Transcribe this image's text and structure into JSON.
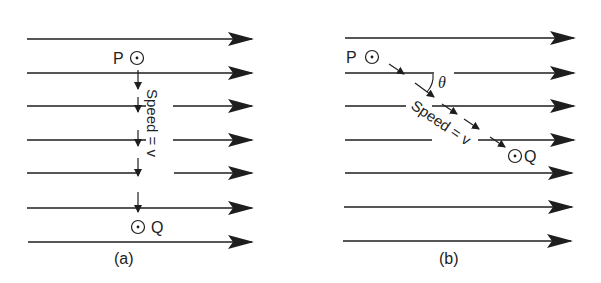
{
  "colors": {
    "ink": "#1e1e1e",
    "background": "#ffffff"
  },
  "panel_a": {
    "caption": "(a)",
    "point_p": "P",
    "point_q": "Q",
    "speed_label": "Speed = v",
    "field_lines": 7,
    "path": "vertical, perpendicular to field lines"
  },
  "panel_b": {
    "caption": "(b)",
    "point_p": "P",
    "point_q": "Q",
    "speed_label": "Speed = v",
    "angle_label": "θ",
    "field_lines": 7,
    "path": "diagonal, at angle θ to field lines"
  }
}
